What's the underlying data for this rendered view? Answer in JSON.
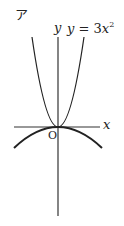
{
  "figure": {
    "panel_label": "ア",
    "y_axis_label": "y",
    "x_axis_label": "x",
    "origin_label": "O",
    "curve_label": {
      "lhs": "y",
      "eq": " = 3",
      "var": "x",
      "exp": "2"
    },
    "curves": [
      {
        "name": "upward-parabola",
        "equation": "y = 3x^2",
        "opens": "up"
      },
      {
        "name": "downward-parabola",
        "equation": "",
        "opens": "down"
      }
    ],
    "colors": {
      "axis": "#333333",
      "curve": "#222222",
      "text": "#222222",
      "background": "#ffffff"
    }
  }
}
